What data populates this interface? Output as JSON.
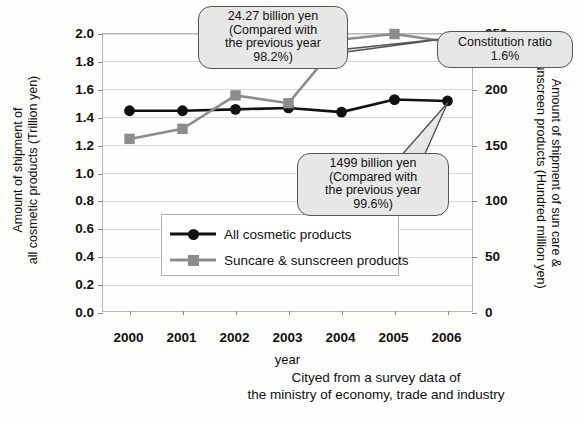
{
  "chart_data": {
    "type": "line",
    "title": "",
    "xlabel": "year",
    "categories": [
      "2000",
      "2001",
      "2002",
      "2003",
      "2004",
      "2005",
      "2006"
    ],
    "grid": true,
    "legend_position": "center-left inside plot",
    "left_axis": {
      "label_line1": "Amount of shipment of",
      "label_line2": "all cosmetic products (Trillion yen)",
      "ticks": [
        "0.0",
        "0.2",
        "0.4",
        "0.6",
        "0.8",
        "1.0",
        "1.2",
        "1.4",
        "1.6",
        "1.8",
        "2.0"
      ],
      "min": 0.0,
      "max": 2.0,
      "step": 0.2
    },
    "right_axis": {
      "label_line1": "Amount of shipment of sun care &",
      "label_line2": "sunscreen products (Hundred million yen)",
      "ticks": [
        "0",
        "50",
        "100",
        "150",
        "200",
        "250"
      ],
      "min": 0,
      "max": 250,
      "step": 50
    },
    "series": [
      {
        "name": "All cosmetic products",
        "axis": "left",
        "marker": "circle",
        "color": "#111111",
        "values": [
          1.45,
          1.45,
          1.46,
          1.47,
          1.44,
          1.53,
          1.52
        ]
      },
      {
        "name": "Suncare & sunscreen products",
        "axis": "right",
        "marker": "square",
        "color": "#8d8d8d",
        "values": [
          156,
          165,
          195,
          188,
          245,
          250,
          243
        ]
      }
    ],
    "annotations": [
      {
        "id": "suncare-2006",
        "line1": "24.27 billion yen",
        "line2": "(Compared with",
        "line3": "the previous year 98.2%)",
        "points_to": "2006 suncare & sunscreen data point"
      },
      {
        "id": "constitution-ratio",
        "line1": "Constitution ratio 1.6%",
        "points_to": "2006 suncare & sunscreen data point"
      },
      {
        "id": "cosmetics-2006",
        "line1": "1499 billion yen",
        "line2": "(Compared with",
        "line3": "the previous year 99.6%)",
        "points_to": "2006 all cosmetic products data point"
      }
    ]
  },
  "legend": {
    "items": [
      {
        "label": "All cosmetic products"
      },
      {
        "label": "Suncare & sunscreen products"
      }
    ]
  },
  "footer": {
    "line1": "Cityed from a survey data  of",
    "line2": "the ministry of economy, trade and industry"
  }
}
